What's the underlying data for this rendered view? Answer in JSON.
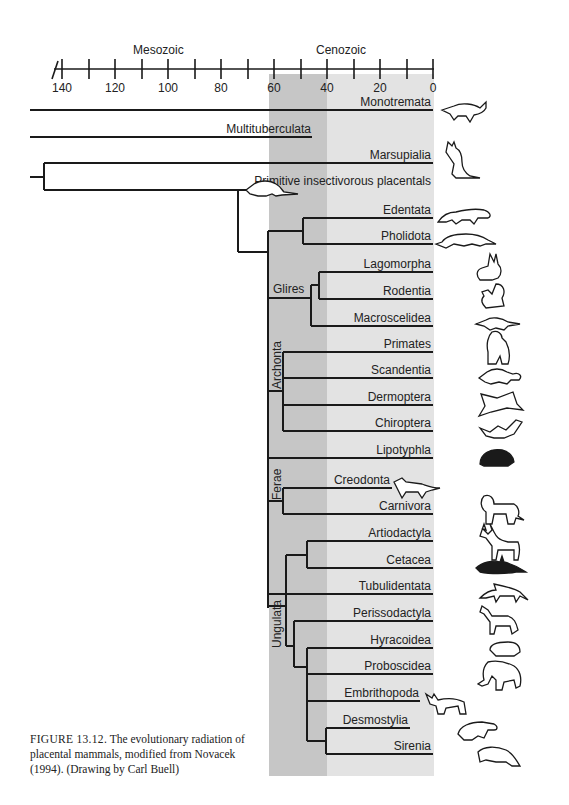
{
  "caption": {
    "figure_number": "FIGURE 13.12.",
    "text": "The evolutionary radiation of placental mammals, modified from Novacek (1994). (Drawing by Carl Buell)"
  },
  "axis": {
    "unit": "Ma",
    "eras": [
      {
        "label": "Mesozoic"
      },
      {
        "label": "Cenozoic"
      }
    ],
    "tick_labels": [
      "140",
      "120",
      "100",
      "80",
      "60",
      "40",
      "20",
      "0"
    ],
    "minor_ticks": [
      140,
      130,
      120,
      110,
      100,
      90,
      80,
      70,
      60,
      50,
      40,
      30,
      20,
      10,
      0
    ]
  },
  "shading": {
    "dark_band": {
      "from_ma": 70,
      "to_ma": 50,
      "color": "#c4c4c4"
    },
    "light_band": {
      "from_ma": 50,
      "to_ma": 0,
      "color": "#e2e2e2"
    }
  },
  "clades": [
    {
      "label": "Glires"
    },
    {
      "label": "Archonta"
    },
    {
      "label": "Ferae"
    },
    {
      "label": "Ungulata"
    }
  ],
  "taxa": [
    {
      "label": "Monotremata",
      "icon": "platypus-icon"
    },
    {
      "label": "Multituberculata",
      "icon": ""
    },
    {
      "label": "Marsupialia",
      "icon": "kangaroo-icon"
    },
    {
      "label": "Primitive insectivorous placentals",
      "icon": "shrew-icon"
    },
    {
      "label": "Edentata",
      "icon": "anteater-icon"
    },
    {
      "label": "Pholidota",
      "icon": "pangolin-icon"
    },
    {
      "label": "Lagomorpha",
      "icon": "rabbit-icon"
    },
    {
      "label": "Rodentia",
      "icon": "squirrel-icon"
    },
    {
      "label": "Macroscelidea",
      "icon": "elephant-shrew-icon"
    },
    {
      "label": "Primates",
      "icon": "gorilla-icon"
    },
    {
      "label": "Scandentia",
      "icon": "tree-shrew-icon"
    },
    {
      "label": "Dermoptera",
      "icon": "colugo-icon"
    },
    {
      "label": "Chiroptera",
      "icon": "bat-icon"
    },
    {
      "label": "Lipotyphla",
      "icon": "hedgehog-icon"
    },
    {
      "label": "Creodonta",
      "icon": "creodont-icon"
    },
    {
      "label": "Carnivora",
      "icon": "lion-icon"
    },
    {
      "label": "Artiodactyla",
      "icon": "deer-icon"
    },
    {
      "label": "Cetacea",
      "icon": "orca-icon"
    },
    {
      "label": "Tubulidentata",
      "icon": "aardvark-icon"
    },
    {
      "label": "Perissodactyla",
      "icon": "horse-icon"
    },
    {
      "label": "Hyracoidea",
      "icon": "hyrax-icon"
    },
    {
      "label": "Proboscidea",
      "icon": "mammoth-icon"
    },
    {
      "label": "Embrithopoda",
      "icon": "arsinoitherium-icon"
    },
    {
      "label": "Desmostylia",
      "icon": "desmostylian-icon"
    },
    {
      "label": "Sirenia",
      "icon": "manatee-icon"
    }
  ]
}
